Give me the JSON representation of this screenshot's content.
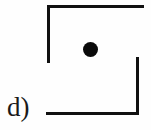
{
  "figure": {
    "panel_label": "d)",
    "background_color": "#fefefe",
    "ink_color": "#111111",
    "width_px": 151,
    "height_px": 130,
    "marker": {
      "name": "center-dot",
      "shape": "filled-circle",
      "color": "#0a0a0a",
      "center_x_px": 90,
      "center_y_px": 49,
      "diameter_px": 15
    },
    "strokes": [
      {
        "name": "top-rule",
        "orientation": "horizontal",
        "x_px": 47,
        "y_px": 5,
        "length_px": 97,
        "thickness_px": 3
      },
      {
        "name": "left-rule",
        "orientation": "vertical",
        "x_px": 47,
        "y_px": 5,
        "length_px": 58,
        "thickness_px": 3
      },
      {
        "name": "right-rule",
        "orientation": "vertical",
        "x_px": 136,
        "y_px": 57,
        "length_px": 58,
        "thickness_px": 3
      },
      {
        "name": "bottom-rule",
        "orientation": "horizontal",
        "x_px": 46,
        "y_px": 112,
        "length_px": 93,
        "thickness_px": 3
      }
    ]
  }
}
